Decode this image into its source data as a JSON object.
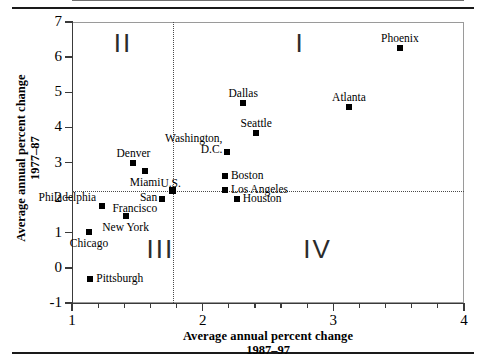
{
  "chart_data": {
    "type": "scatter",
    "title": "",
    "xlabel": "Average annual percent change",
    "xlabel_line2": "1987–97",
    "ylabel": "Average annual percent change",
    "ylabel_line2": "1977–87",
    "xlim": [
      1,
      4
    ],
    "ylim": [
      -1,
      7
    ],
    "x_ticks": [
      "1",
      "2",
      "3",
      "4"
    ],
    "x_tick_values": [
      1,
      2,
      3,
      4
    ],
    "x_minor_step": 0.2,
    "y_ticks": [
      "7",
      "6",
      "5",
      "4",
      "3",
      "2",
      "1",
      "0",
      "-1"
    ],
    "y_tick_values": [
      7,
      6,
      5,
      4,
      3,
      2,
      1,
      0,
      -1
    ],
    "grid": false,
    "legend": "none",
    "reference_lines": {
      "x": 1.77,
      "y": 2.2,
      "style": "dotted",
      "label": "U.S."
    },
    "quadrants": [
      {
        "name": "I",
        "label": "I",
        "x": 2.71,
        "y": 6.4
      },
      {
        "name": "II",
        "label": "II",
        "x": 1.32,
        "y": 6.4
      },
      {
        "name": "III",
        "label": "III",
        "x": 1.57,
        "y": 0.55
      },
      {
        "name": "IV",
        "label": "IV",
        "x": 2.77,
        "y": 0.55
      }
    ],
    "points": [
      {
        "label": "Phoenix",
        "x": 3.51,
        "y": 6.25,
        "label_pos": "top"
      },
      {
        "label": "Dallas",
        "x": 2.31,
        "y": 4.68,
        "label_pos": "top"
      },
      {
        "label": "Atlanta",
        "x": 3.12,
        "y": 4.57,
        "label_pos": "top"
      },
      {
        "label": "Seattle",
        "x": 2.41,
        "y": 3.85,
        "label_pos": "top"
      },
      {
        "label": "Washington, D.C.",
        "x": 2.19,
        "y": 3.3,
        "label_pos": "left-two-line"
      },
      {
        "label": "Denver",
        "x": 1.47,
        "y": 3.0,
        "label_pos": "top"
      },
      {
        "label": "Miami",
        "x": 1.56,
        "y": 2.77,
        "label_pos": "bottom"
      },
      {
        "label": "Boston",
        "x": 2.17,
        "y": 2.61,
        "label_pos": "right"
      },
      {
        "label": "Los Angeles",
        "x": 2.17,
        "y": 2.23,
        "label_pos": "right"
      },
      {
        "label": "U.S.",
        "x": 1.77,
        "y": 2.2,
        "label_pos": "top-left",
        "is_reference": true
      },
      {
        "label": "Houston",
        "x": 2.26,
        "y": 1.96,
        "label_pos": "right"
      },
      {
        "label": "San Francisco",
        "x": 1.69,
        "y": 1.97,
        "label_pos": "left-two-line"
      },
      {
        "label": "Philadelphia",
        "x": 1.23,
        "y": 1.77,
        "label_pos": "top-left"
      },
      {
        "label": "New York",
        "x": 1.41,
        "y": 1.48,
        "label_pos": "bottom"
      },
      {
        "label": "Chicago",
        "x": 1.13,
        "y": 1.02,
        "label_pos": "bottom"
      },
      {
        "label": "Pittsburgh",
        "x": 1.14,
        "y": -0.32,
        "label_pos": "right"
      }
    ]
  },
  "colors": {
    "marker": "#000000",
    "axis": "#3a3a3a",
    "frame": "#9a9a9a",
    "reference": "#4a4a4a",
    "rule": "#1a1a1a",
    "background": "#ffffff"
  }
}
